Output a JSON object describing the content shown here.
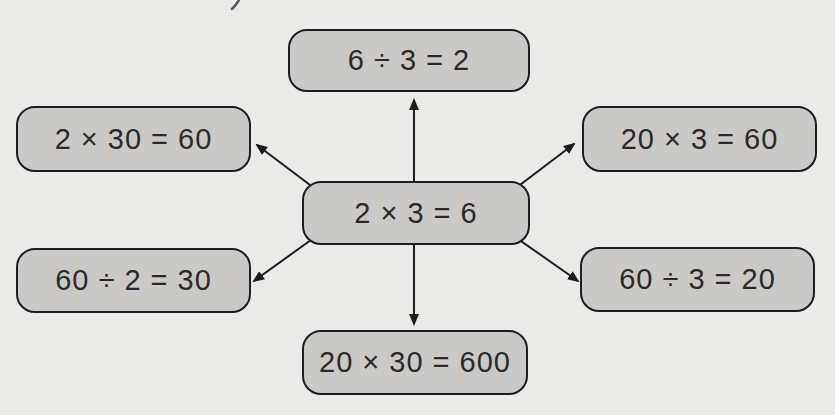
{
  "figure": {
    "center_node": {
      "id": "center",
      "label": "2 × 3 = 6"
    },
    "nodes": [
      {
        "id": "top",
        "label": "6 ÷ 3 = 2"
      },
      {
        "id": "upper-left",
        "label": "2 × 30 = 60"
      },
      {
        "id": "upper-right",
        "label": "20 × 3 = 60"
      },
      {
        "id": "lower-left",
        "label": "60 ÷ 2 = 30"
      },
      {
        "id": "lower-right",
        "label": "60 ÷ 3 = 20"
      },
      {
        "id": "bottom",
        "label": "20 × 30 = 600"
      }
    ],
    "colors": {
      "background": "#eceae7",
      "node_fill": "#cbc9c6",
      "node_border": "#1d1d1d",
      "text": "#2a2a2a",
      "arrow": "#1d1d1d"
    }
  }
}
